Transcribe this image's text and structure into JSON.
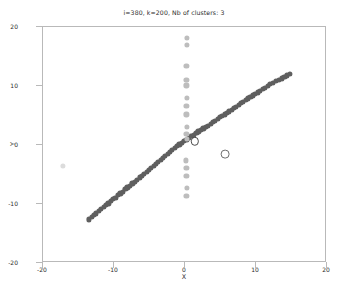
{
  "chart_data": {
    "type": "scatter",
    "title": "i=380,  k=200, Nb of clusters: 3",
    "xlabel": "X",
    "ylabel": "Y",
    "xlim": [
      -20,
      20
    ],
    "ylim": [
      -20,
      20
    ],
    "xticks": [
      -20,
      -10,
      0,
      10,
      20
    ],
    "yticks": [
      -20,
      -10,
      0,
      10,
      20
    ],
    "xtick_labels": [
      "-20",
      "-10",
      "0",
      "10",
      "20"
    ],
    "ytick_labels": [
      "-20",
      "-10",
      "0",
      "10",
      "20"
    ],
    "grid": false,
    "legend": "none",
    "marker_size_px": 5.2,
    "series": [
      {
        "name": "cluster-diagonal",
        "color": "#5f5f5f",
        "points": [
          [
            -13.5,
            -12.6
          ],
          [
            -13.1,
            -12.2
          ],
          [
            -12.8,
            -11.9
          ],
          [
            -12.5,
            -11.6
          ],
          [
            -12.1,
            -11.2
          ],
          [
            -11.8,
            -10.9
          ],
          [
            -11.4,
            -10.5
          ],
          [
            -11.1,
            -10.2
          ],
          [
            -10.8,
            -9.9
          ],
          [
            -10.4,
            -9.5
          ],
          [
            -10.1,
            -9.2
          ],
          [
            -9.8,
            -8.9
          ],
          [
            -9.4,
            -8.5
          ],
          [
            -9.1,
            -8.2
          ],
          [
            -8.8,
            -7.9
          ],
          [
            -8.4,
            -7.5
          ],
          [
            -8.1,
            -7.2
          ],
          [
            -7.8,
            -6.9
          ],
          [
            -7.4,
            -6.5
          ],
          [
            -7.1,
            -6.2
          ],
          [
            -6.8,
            -5.9
          ],
          [
            -6.4,
            -5.5
          ],
          [
            -6.1,
            -5.2
          ],
          [
            -5.8,
            -4.9
          ],
          [
            -5.4,
            -4.5
          ],
          [
            -5.1,
            -4.2
          ],
          [
            -4.8,
            -3.9
          ],
          [
            -4.4,
            -3.5
          ],
          [
            -4.1,
            -3.2
          ],
          [
            -3.8,
            -2.9
          ],
          [
            -3.4,
            -2.5
          ],
          [
            -3.1,
            -2.2
          ],
          [
            -2.8,
            -1.9
          ],
          [
            -2.4,
            -1.5
          ],
          [
            -2.1,
            -1.2
          ],
          [
            -1.8,
            -0.9
          ],
          [
            -1.4,
            -0.5
          ],
          [
            -1.1,
            -0.2
          ],
          [
            -0.8,
            0.1
          ],
          [
            -0.4,
            0.4
          ],
          [
            -0.1,
            0.7
          ],
          [
            0.2,
            0.9
          ],
          [
            0.5,
            1.2
          ],
          [
            0.9,
            1.5
          ],
          [
            1.2,
            1.7
          ],
          [
            1.6,
            2.0
          ],
          [
            1.9,
            2.3
          ],
          [
            2.2,
            2.5
          ],
          [
            2.6,
            2.8
          ],
          [
            2.9,
            3.1
          ],
          [
            3.2,
            3.3
          ],
          [
            3.6,
            3.6
          ],
          [
            3.9,
            3.9
          ],
          [
            4.2,
            4.1
          ],
          [
            4.6,
            4.4
          ],
          [
            4.9,
            4.7
          ],
          [
            5.2,
            4.9
          ],
          [
            5.6,
            5.2
          ],
          [
            5.9,
            5.5
          ],
          [
            6.2,
            5.7
          ],
          [
            6.6,
            6.0
          ],
          [
            6.9,
            6.3
          ],
          [
            7.2,
            6.5
          ],
          [
            7.6,
            6.8
          ],
          [
            7.9,
            7.1
          ],
          [
            8.2,
            7.3
          ],
          [
            8.6,
            7.6
          ],
          [
            8.9,
            7.9
          ],
          [
            9.2,
            8.1
          ],
          [
            9.6,
            8.4
          ],
          [
            9.9,
            8.7
          ],
          [
            10.3,
            8.9
          ],
          [
            10.6,
            9.2
          ],
          [
            11.0,
            9.5
          ],
          [
            11.3,
            9.7
          ],
          [
            11.7,
            10.0
          ],
          [
            12.0,
            10.3
          ],
          [
            12.4,
            10.5
          ],
          [
            12.8,
            10.8
          ],
          [
            13.2,
            11.0
          ],
          [
            13.6,
            11.3
          ],
          [
            14.0,
            11.6
          ],
          [
            14.4,
            11.8
          ],
          [
            14.8,
            12.1
          ]
        ]
      },
      {
        "name": "cluster-vertical",
        "color": "#bdbdbd",
        "points": [
          [
            0.3,
            18.2
          ],
          [
            0.3,
            16.9
          ],
          [
            0.2,
            13.4
          ],
          [
            0.2,
            11.1
          ],
          [
            0.2,
            10.1
          ],
          [
            0.3,
            8.0
          ],
          [
            0.2,
            6.6
          ],
          [
            0.2,
            5.2
          ],
          [
            0.3,
            3.0
          ],
          [
            0.2,
            1.9
          ],
          [
            0.3,
            1.0
          ],
          [
            0.1,
            -2.6
          ],
          [
            0.2,
            -3.9
          ],
          [
            0.2,
            -5.3
          ],
          [
            0.3,
            -7.3
          ],
          [
            0.2,
            -8.6
          ]
        ]
      },
      {
        "name": "cluster-outlier",
        "color": "#dcdcdc",
        "points": [
          [
            -17.2,
            -3.6
          ]
        ]
      }
    ],
    "centroids": [
      {
        "name": "centroid-1",
        "x": 1.4,
        "y": 0.6,
        "color": "#4a4a4a",
        "radius_px": 4.2
      },
      {
        "name": "centroid-2",
        "x": 5.6,
        "y": -1.5,
        "color": "#6e6e6e",
        "radius_px": 4.4
      }
    ]
  }
}
